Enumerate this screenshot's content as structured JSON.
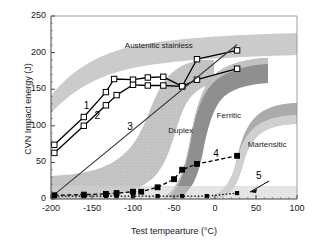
{
  "chart_data": {
    "type": "line",
    "title": "",
    "xlabel": "Test tempearture (°C)",
    "ylabel": "CVN Impact energy (J)",
    "xlim": [
      -200,
      100
    ],
    "ylim": [
      0,
      250
    ],
    "xticks": [
      -200,
      -150,
      -100,
      -50,
      0,
      50,
      100
    ],
    "yticks": [
      0,
      50,
      100,
      150,
      200,
      250
    ],
    "xtick_labels": [
      "-200",
      "-150",
      "-100",
      "-50",
      "0",
      "50",
      "100"
    ],
    "ytick_labels": [
      "0",
      "50",
      "100",
      "150",
      "200",
      "250"
    ],
    "grid": false,
    "legend": "none",
    "annotations": [
      {
        "name": "austenitic-band-label",
        "text": "Austenitic stainless",
        "x": -110,
        "y": 208
      },
      {
        "name": "duplex-band-label",
        "text": "Duplex",
        "x": -57,
        "y": 92
      },
      {
        "name": "ferritic-band-label",
        "text": "Ferritic",
        "x": 2,
        "y": 112
      },
      {
        "name": "martensitic-band-label",
        "text": "Martensitic",
        "x": 40,
        "y": 73
      },
      {
        "name": "series-1-label",
        "text": "1",
        "x": -160,
        "y": 127
      },
      {
        "name": "series-2-label",
        "text": "2",
        "x": -147,
        "y": 113
      },
      {
        "name": "series-3-label",
        "text": "3",
        "x": -107,
        "y": 98
      },
      {
        "name": "series-4-label",
        "text": "4",
        "x": -2,
        "y": 62
      },
      {
        "name": "series-5-label",
        "text": "5",
        "x": 50,
        "y": 31
      }
    ],
    "series": [
      {
        "name": "1",
        "marker": "open-square",
        "linestyle": "solid",
        "color": "#000000",
        "x": [
          -196,
          -160,
          -133,
          -123,
          -100,
          -82,
          -63,
          -40,
          -22,
          27
        ],
        "y": [
          74,
          112,
          146,
          164,
          163,
          166,
          167,
          154,
          191,
          203
        ]
      },
      {
        "name": "2",
        "marker": "open-square",
        "linestyle": "solid",
        "color": "#000000",
        "x": [
          -196,
          -160,
          -133,
          -120,
          -100,
          -82,
          -63,
          -40,
          -22,
          27
        ],
        "y": [
          63,
          100,
          128,
          142,
          156,
          155,
          155,
          154,
          163,
          178
        ]
      },
      {
        "name": "3",
        "marker": "none",
        "linestyle": "solid",
        "color": "#3a3a3a",
        "x": [
          -196,
          27
        ],
        "y": [
          6,
          211
        ]
      },
      {
        "name": "4",
        "marker": "filled-square",
        "linestyle": "dashed",
        "color": "#000000",
        "x": [
          -196,
          -160,
          -133,
          -120,
          -100,
          -90,
          -70,
          -50,
          -40,
          -22,
          27
        ],
        "y": [
          5,
          6,
          7,
          8,
          10,
          10,
          16,
          27,
          40,
          48,
          59
        ]
      },
      {
        "name": "5",
        "marker": "filled-square",
        "linestyle": "dotted",
        "color": "#000000",
        "x": [
          -196,
          -160,
          -133,
          -120,
          -100,
          -70,
          -40,
          -10,
          27
        ],
        "y": [
          4,
          4,
          4,
          4,
          4,
          4,
          4,
          4,
          8
        ]
      }
    ],
    "bands": [
      {
        "name": "austenitic-stainless",
        "label": "Austenitic stainless",
        "shade": "#c9c9c9"
      },
      {
        "name": "duplex",
        "label": "Duplex",
        "shade": "#bdbdbd"
      },
      {
        "name": "ferritic",
        "label": "Ferritic",
        "shade": "#9a9a9a"
      },
      {
        "name": "martensitic",
        "label": "Martensitic",
        "shade": "#a8a8a8"
      }
    ]
  }
}
